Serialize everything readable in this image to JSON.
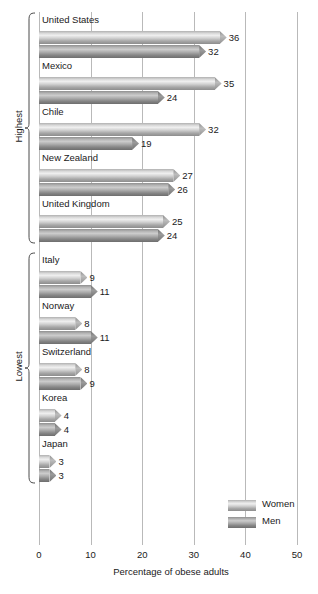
{
  "chart_data": {
    "type": "bar",
    "orientation": "horizontal",
    "title": "",
    "xlabel": "Percentage of obese adults",
    "ylabel": "",
    "xlim": [
      0,
      50
    ],
    "xticks": [
      "0",
      "10",
      "20",
      "30",
      "40",
      "50"
    ],
    "grid": true,
    "legend_position": "bottom-right",
    "series": [
      {
        "name": "Women",
        "color": "#cfcfcf",
        "values": [
          36,
          35,
          32,
          27,
          25,
          9,
          8,
          8,
          4,
          3
        ]
      },
      {
        "name": "Men",
        "color": "#9b9b9b",
        "values": [
          32,
          24,
          19,
          26,
          24,
          11,
          11,
          9,
          4,
          3
        ]
      }
    ],
    "categories": [
      "United States",
      "Mexico",
      "Chile",
      "New Zealand",
      "United Kingdom",
      "Italy",
      "Norway",
      "Switzerland",
      "Korea",
      "Japan"
    ],
    "groups": [
      {
        "label": "Highest",
        "countries": [
          {
            "name": "United States",
            "women": 36,
            "men": 32
          },
          {
            "name": "Mexico",
            "women": 35,
            "men": 24
          },
          {
            "name": "Chile",
            "women": 32,
            "men": 19
          },
          {
            "name": "New Zealand",
            "women": 27,
            "men": 26
          },
          {
            "name": "United Kingdom",
            "women": 25,
            "men": 24
          }
        ]
      },
      {
        "label": "Lowest",
        "countries": [
          {
            "name": "Italy",
            "women": 9,
            "men": 11
          },
          {
            "name": "Norway",
            "women": 8,
            "men": 11
          },
          {
            "name": "Switzerland",
            "women": 8,
            "men": 9
          },
          {
            "name": "Korea",
            "women": 4,
            "men": 4
          },
          {
            "name": "Japan",
            "women": 3,
            "men": 3
          }
        ]
      }
    ]
  },
  "legend": {
    "items": [
      {
        "label": "Women",
        "variant": "women"
      },
      {
        "label": "Men",
        "variant": "men"
      }
    ]
  },
  "axis": {
    "title": "Percentage of obese adults",
    "ticks": [
      "0",
      "10",
      "20",
      "30",
      "40",
      "50"
    ]
  }
}
